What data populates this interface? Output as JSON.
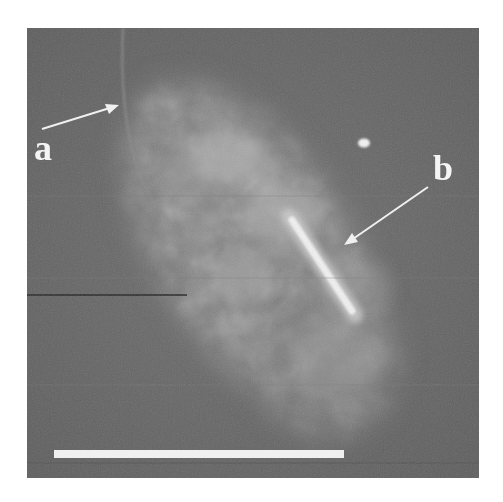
{
  "figure": {
    "type": "grayscale micrograph",
    "background_color": "#6a6a6a",
    "annotations": [
      {
        "id": "a",
        "label": "a",
        "arrow_from": [
          42,
          129
        ],
        "arrow_to": [
          118,
          105
        ]
      },
      {
        "id": "b",
        "label": "b",
        "arrow_from": [
          428,
          187
        ],
        "arrow_to": [
          344,
          245
        ]
      }
    ],
    "features": {
      "bright_rod": {
        "from": [
          295,
          215
        ],
        "to": [
          355,
          315
        ]
      },
      "bright_spot": {
        "center": [
          364,
          143
        ]
      },
      "faint_arc": "curved faint line near label a",
      "dark_streak_y": 295
    },
    "scale_bar": {
      "x_start": 54,
      "x_end": 344,
      "y": 450,
      "color": "#f0f0f0",
      "label": ""
    }
  }
}
